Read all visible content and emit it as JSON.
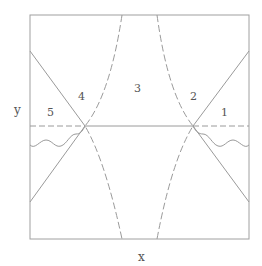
{
  "diagram": {
    "axes": {
      "x_label": "x",
      "y_label": "y"
    },
    "regions": [
      {
        "id": "1",
        "label": "1"
      },
      {
        "id": "2",
        "label": "2"
      },
      {
        "id": "3",
        "label": "3"
      },
      {
        "id": "4",
        "label": "4"
      },
      {
        "id": "5",
        "label": "5"
      }
    ],
    "colors": {
      "line": "#9a9a9a",
      "text": "#555555",
      "background": "#ffffff"
    }
  }
}
